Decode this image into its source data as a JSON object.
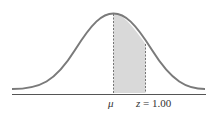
{
  "diagram": {
    "type": "normal-distribution-shaded",
    "labels": {
      "mean": "μ",
      "z_var": "z",
      "z_eq": " = 1.00"
    },
    "shaded_region": {
      "from": "μ",
      "to": "z = 1.00"
    },
    "colors": {
      "curve": "#7a7a7a",
      "shade": "#d9d9d9",
      "axis": "#555555",
      "dashed": "#555555"
    }
  }
}
